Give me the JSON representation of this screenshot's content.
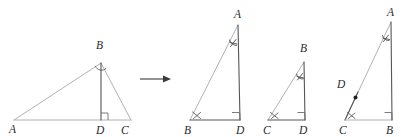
{
  "figure": {
    "stroke_color_light": "#a8a8a8",
    "stroke_color_dark": "#555555",
    "label_color": "#2a2a2a",
    "background": "#ffffff",
    "transform_arrow": {
      "name": "rightward-arrow",
      "symbol": "→"
    },
    "panels": [
      {
        "id": "original-triangle",
        "name": "Original triangle ABC with altitude BD",
        "vertex_labels": [
          "A",
          "B",
          "D",
          "C"
        ],
        "labels": [
          {
            "text": "A",
            "x": 9,
            "y": 128
          },
          {
            "text": "B",
            "x": 97,
            "y": 44
          },
          {
            "text": "D",
            "x": 98,
            "y": 131
          },
          {
            "text": "C",
            "x": 122,
            "y": 131
          }
        ],
        "marks": {
          "right_angle_at": "D",
          "angle_arc_at": "B"
        }
      },
      {
        "id": "triangle-abd",
        "name": "Sub-triangle ABD",
        "vertex_labels": [
          "A",
          "B",
          "D"
        ],
        "labels": [
          {
            "text": "A",
            "x": 236,
            "y": 16
          },
          {
            "text": "B",
            "x": 186,
            "y": 132
          },
          {
            "text": "D",
            "x": 249,
            "y": 132
          }
        ],
        "marks": {
          "right_angle_at": "D",
          "angle_x_at": "B",
          "tick_on_side": "AB-near-A"
        }
      },
      {
        "id": "triangle-bcd",
        "name": "Sub-triangle BCD",
        "vertex_labels": [
          "B",
          "C",
          "D"
        ],
        "labels": [
          {
            "text": "B",
            "x": 302,
            "y": 49
          },
          {
            "text": "C",
            "x": 266,
            "y": 132
          },
          {
            "text": "D",
            "x": 300,
            "y": 132
          }
        ],
        "marks": {
          "right_angle_at": "D",
          "angle_x_at": "C",
          "tick_on_side": "BC-near-B"
        }
      },
      {
        "id": "triangle-acb",
        "name": "Whole triangle ACB with point D on CA",
        "vertex_labels": [
          "A",
          "D",
          "C",
          "B"
        ],
        "labels": [
          {
            "text": "A",
            "x": 389,
            "y": 14
          },
          {
            "text": "D",
            "x": 340,
            "y": 83
          },
          {
            "text": "C",
            "x": 341,
            "y": 132
          },
          {
            "text": "B",
            "x": 388,
            "y": 132
          }
        ],
        "marks": {
          "right_angle_at": "B",
          "angle_x_at": "C",
          "tick_on_side": "CA-near-A",
          "point_dot_at": "D"
        }
      }
    ]
  }
}
